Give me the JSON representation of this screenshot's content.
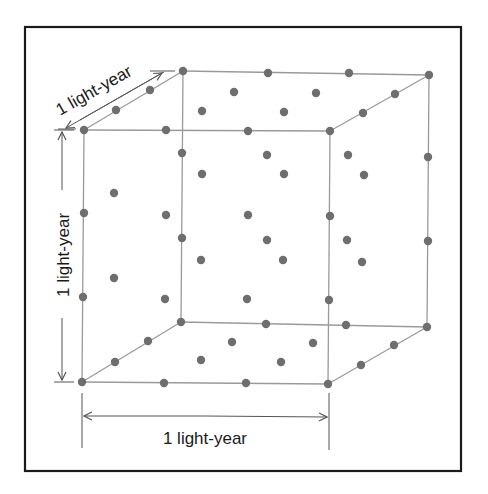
{
  "diagram": {
    "title": "",
    "labels": {
      "depth": "1 light-year",
      "height": "1 light-year",
      "width": "1 light-year"
    },
    "colors": {
      "frame": "#1a1a1a",
      "edges": "#9a9a9a",
      "dots": "#6e6e6e",
      "dimension_lines": "#555555",
      "text": "#1a1a1a"
    },
    "cube": {
      "front_face": {
        "tl": [
          84,
          130
        ],
        "tr": [
          330,
          131
        ],
        "bl": [
          82,
          382
        ],
        "br": [
          328,
          384
        ]
      },
      "back_face": {
        "tl": [
          183,
          71
        ],
        "tr": [
          429,
          75
        ],
        "bl": [
          181,
          322
        ],
        "br": [
          427,
          327
        ]
      }
    },
    "dots": [
      [
        183,
        71
      ],
      [
        268,
        73
      ],
      [
        349,
        73
      ],
      [
        429,
        75
      ],
      [
        150,
        90
      ],
      [
        234,
        92
      ],
      [
        316,
        93
      ],
      [
        395,
        94
      ],
      [
        116,
        110
      ],
      [
        202,
        111
      ],
      [
        284,
        112
      ],
      [
        363,
        113
      ],
      [
        84,
        130
      ],
      [
        166,
        130
      ],
      [
        248,
        131
      ],
      [
        330,
        131
      ],
      [
        182,
        153
      ],
      [
        267,
        155
      ],
      [
        348,
        155
      ],
      [
        428,
        157
      ],
      [
        114,
        193
      ],
      [
        202,
        174
      ],
      [
        284,
        174
      ],
      [
        364,
        175
      ],
      [
        84,
        213
      ],
      [
        166,
        215
      ],
      [
        248,
        215
      ],
      [
        330,
        216
      ],
      [
        182,
        238
      ],
      [
        267,
        240
      ],
      [
        347,
        240
      ],
      [
        428,
        241
      ],
      [
        114,
        278
      ],
      [
        201,
        260
      ],
      [
        283,
        260
      ],
      [
        362,
        262
      ],
      [
        83,
        297
      ],
      [
        165,
        299
      ],
      [
        247,
        299
      ],
      [
        329,
        300
      ],
      [
        181,
        322
      ],
      [
        266,
        324
      ],
      [
        346,
        325
      ],
      [
        427,
        327
      ],
      [
        148,
        341
      ],
      [
        232,
        342
      ],
      [
        313,
        343
      ],
      [
        394,
        345
      ],
      [
        115,
        362
      ],
      [
        201,
        360
      ],
      [
        281,
        362
      ],
      [
        361,
        365
      ],
      [
        82,
        382
      ],
      [
        164,
        383
      ],
      [
        246,
        383
      ],
      [
        328,
        384
      ]
    ]
  }
}
